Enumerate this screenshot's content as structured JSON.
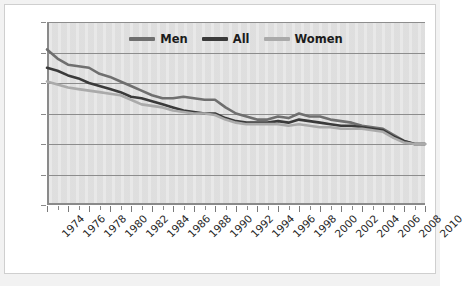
{
  "chart_data": {
    "type": "line",
    "title": "",
    "subtitle": "",
    "xlabel": "",
    "ylabel": "",
    "grid": "horizontal",
    "legend_position": "top-center",
    "ylim": [
      0,
      60
    ],
    "yticks": [
      0,
      10,
      20,
      30,
      40,
      50,
      60
    ],
    "xlim": [
      1974,
      2010
    ],
    "xticks": [
      1974,
      1976,
      1978,
      1980,
      1982,
      1984,
      1986,
      1988,
      1990,
      1992,
      1994,
      1996,
      1998,
      2000,
      2002,
      2004,
      2006,
      2008,
      2010
    ],
    "xtick_labels": [
      "1974",
      "1976",
      "1978",
      "1980",
      "1982",
      "1984",
      "1986",
      "1988",
      "1990",
      "1992",
      "1994",
      "1996",
      "1998",
      "2000",
      "2002",
      "2004",
      "2006",
      "2008",
      "2010"
    ],
    "x": [
      1974,
      1975,
      1976,
      1977,
      1978,
      1979,
      1980,
      1981,
      1982,
      1983,
      1984,
      1985,
      1986,
      1987,
      1988,
      1989,
      1990,
      1991,
      1992,
      1993,
      1994,
      1995,
      1996,
      1997,
      1998,
      1999,
      2000,
      2001,
      2002,
      2003,
      2004,
      2005,
      2006,
      2007,
      2008,
      2009,
      2010
    ],
    "series": [
      {
        "name": "Men",
        "color": "#6f6f6f",
        "values": [
          51,
          48,
          46,
          45.5,
          45,
          43,
          42,
          40.5,
          39,
          37.5,
          36,
          35,
          35,
          35.5,
          35,
          34.5,
          34.5,
          32,
          30,
          29,
          28,
          28,
          29,
          28.5,
          30,
          29,
          29,
          28,
          27.5,
          27,
          26,
          25.5,
          25,
          23,
          21,
          20,
          20
        ]
      },
      {
        "name": "All",
        "color": "#3a3a3a",
        "values": [
          45,
          44,
          42.5,
          41.5,
          40,
          39,
          38,
          37,
          35.5,
          35,
          34,
          33,
          32,
          31,
          30.5,
          30,
          30,
          28.5,
          27.5,
          27,
          27,
          27,
          27.5,
          27,
          28,
          27.5,
          27,
          26.5,
          26,
          26,
          25.5,
          25,
          24.5,
          22.5,
          21,
          20,
          20
        ]
      },
      {
        "name": "Women",
        "color": "#aaaaaa",
        "values": [
          40.5,
          39.5,
          38.5,
          38,
          37.5,
          37,
          36.5,
          36,
          34.5,
          33,
          32.5,
          32,
          31,
          30.5,
          30,
          30,
          29.5,
          28,
          27,
          26.5,
          26.5,
          26.5,
          26.5,
          26,
          26.5,
          26,
          25.5,
          25.5,
          25,
          25,
          25,
          24.5,
          24,
          22,
          20.5,
          20,
          20
        ]
      }
    ]
  },
  "legend": {
    "items": [
      {
        "label": "Men",
        "color": "#6f6f6f"
      },
      {
        "label": "All",
        "color": "#3a3a3a"
      },
      {
        "label": "Women",
        "color": "#aaaaaa"
      }
    ]
  },
  "colors": {
    "plot_background": "#e2e2e2",
    "figure_background": "#f2f2f2",
    "gridline": "#8d8d8d",
    "axis": "#8a8a8a",
    "text": "#262626"
  }
}
